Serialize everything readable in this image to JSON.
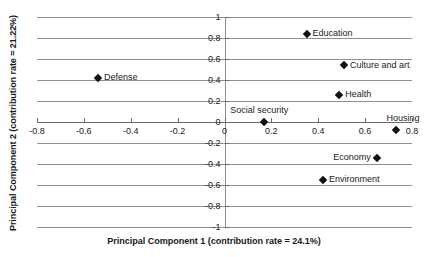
{
  "chart_data": {
    "type": "scatter",
    "title": "",
    "xlabel": "Principal Component 1 (contribution rate = 24.1%)",
    "ylabel": "Principal Component 2 (contribution rate = 21.22%)",
    "xlim": [
      -0.8,
      0.8
    ],
    "ylim": [
      -1,
      1
    ],
    "xticks": [
      -0.8,
      -0.6,
      -0.4,
      -0.2,
      0,
      0.2,
      0.4,
      0.6,
      0.8
    ],
    "xtick_labels": [
      "-0.8",
      "-0.6",
      "-0.4",
      "-0.2",
      "0",
      "0.2",
      "0.4",
      "0.6",
      "0.8"
    ],
    "yticks": [
      1,
      0.8,
      0.6,
      0.4,
      0.2,
      0,
      -0.2,
      -0.4,
      -0.6,
      -0.8,
      -1
    ],
    "ytick_labels": [
      "1",
      "0.8",
      "0.6",
      "0.4",
      "0.2",
      "0",
      "-0.2",
      "-0.4",
      "-0.6",
      "-0.8",
      "-1"
    ],
    "grid": "horizontal",
    "legend": "none",
    "marker": "diamond",
    "marker_color": "#111111",
    "grid_color": "#8f8f8f",
    "axis_color": "#6a6a6a",
    "points": [
      {
        "label": "Education",
        "x": 0.35,
        "y": 0.84,
        "label_pos": "right"
      },
      {
        "label": "Culture and art",
        "x": 0.51,
        "y": 0.54,
        "label_pos": "right"
      },
      {
        "label": "Defense",
        "x": -0.54,
        "y": 0.42,
        "label_pos": "right"
      },
      {
        "label": "Health",
        "x": 0.49,
        "y": 0.26,
        "label_pos": "right"
      },
      {
        "label": "Social security",
        "x": 0.17,
        "y": 0.0,
        "label_pos": "above"
      },
      {
        "label": "Housing",
        "x": 0.73,
        "y": -0.08,
        "label_pos": "above"
      },
      {
        "label": "Economy",
        "x": 0.65,
        "y": -0.34,
        "label_pos": "left"
      },
      {
        "label": "Environment",
        "x": 0.42,
        "y": -0.55,
        "label_pos": "right"
      }
    ]
  }
}
